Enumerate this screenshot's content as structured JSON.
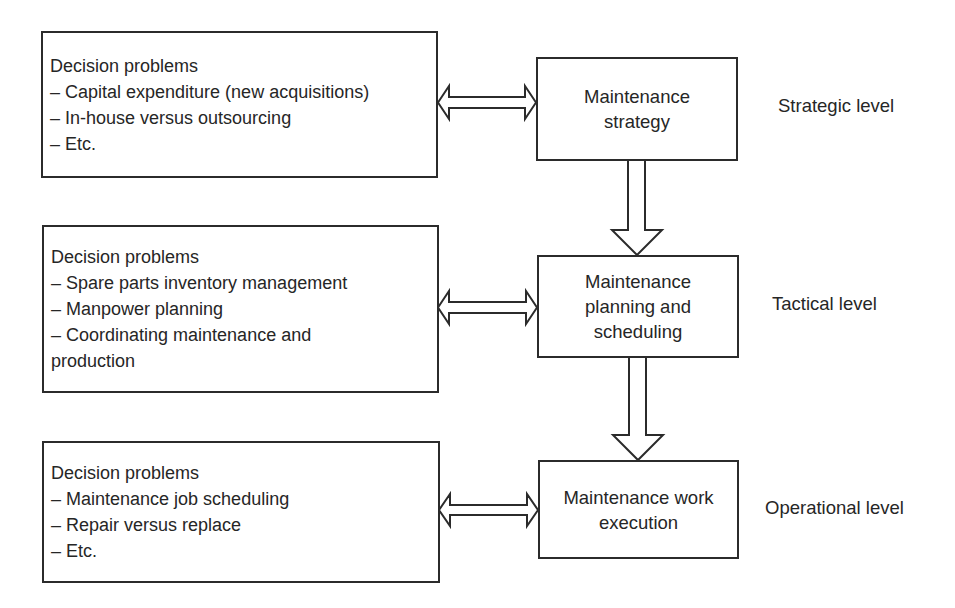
{
  "diagram": {
    "rows": [
      {
        "level": "Strategic level",
        "activity": [
          "Maintenance",
          "strategy"
        ],
        "decision_problems": {
          "heading": "Decision problems",
          "items": [
            "– Capital expenditure (new acquisitions)",
            "– In-house versus outsourcing",
            "– Etc."
          ]
        }
      },
      {
        "level": "Tactical level",
        "activity": [
          "Maintenance",
          "planning and",
          "scheduling"
        ],
        "decision_problems": {
          "heading": "Decision problems",
          "items": [
            "– Spare parts inventory management",
            "– Manpower planning",
            "– Coordinating maintenance and",
            "production"
          ]
        }
      },
      {
        "level": "Operational level",
        "activity": [
          "Maintenance work",
          "execution"
        ],
        "decision_problems": {
          "heading": "Decision problems",
          "items": [
            "– Maintenance job scheduling",
            "– Repair versus replace",
            "– Etc."
          ]
        }
      }
    ],
    "connectors": {
      "horizontal": "bidirectional hollow arrow between decision-problems box and activity box",
      "vertical": "hollow downward arrow from upper activity to lower activity"
    },
    "colors": {
      "line": "#2b2b2b",
      "text": "#262626",
      "background": "#ffffff"
    }
  }
}
